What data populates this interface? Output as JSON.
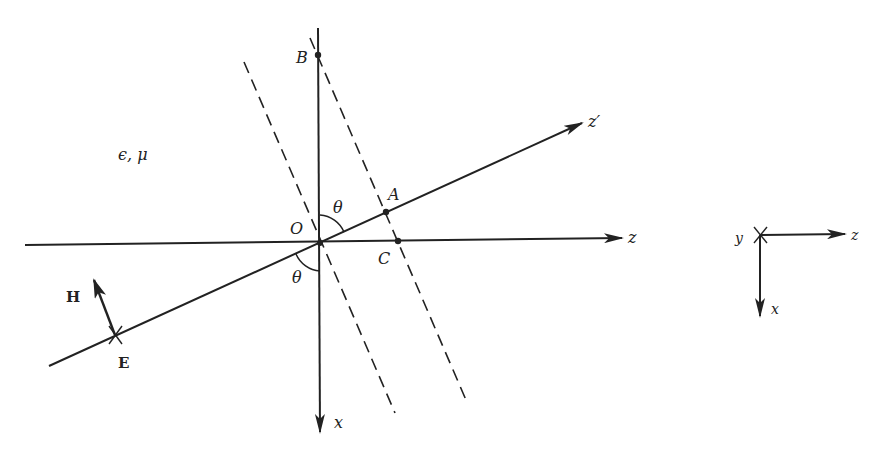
{
  "figure": {
    "labels": {
      "medium": "ϵ, μ",
      "point_B": "B",
      "point_O": "O",
      "point_A": "A",
      "point_C": "C",
      "angle_upper": "θ",
      "angle_lower": "θ",
      "axis_z_prime": "z′",
      "axis_z": "z",
      "axis_x": "x",
      "field_H": "H",
      "field_E": "E"
    },
    "coord_frame": {
      "y": "y",
      "z": "z",
      "x": "x"
    },
    "colors": {
      "stroke": "#222222",
      "background": "#ffffff"
    }
  }
}
